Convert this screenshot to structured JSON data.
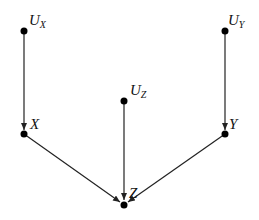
{
  "diagram": {
    "type": "causal-graph",
    "nodes": [
      {
        "id": "UX",
        "label": "U",
        "sub": "X",
        "x": 24,
        "y": 31
      },
      {
        "id": "UZ",
        "label": "U",
        "sub": "Z",
        "x": 124,
        "y": 101
      },
      {
        "id": "UY",
        "label": "U",
        "sub": "Y",
        "x": 225,
        "y": 31
      },
      {
        "id": "X",
        "label": "X",
        "sub": "",
        "x": 24,
        "y": 134
      },
      {
        "id": "Y",
        "label": "Y",
        "sub": "",
        "x": 225,
        "y": 134
      },
      {
        "id": "Z",
        "label": "Z",
        "sub": "",
        "x": 124,
        "y": 205
      }
    ],
    "edges": [
      {
        "from": "UX",
        "to": "X"
      },
      {
        "from": "UY",
        "to": "Y"
      },
      {
        "from": "UZ",
        "to": "Z"
      },
      {
        "from": "X",
        "to": "Z"
      },
      {
        "from": "Y",
        "to": "Z"
      }
    ],
    "colors": {
      "node": "#000000",
      "edge": "#222222",
      "background": "#ffffff"
    }
  }
}
